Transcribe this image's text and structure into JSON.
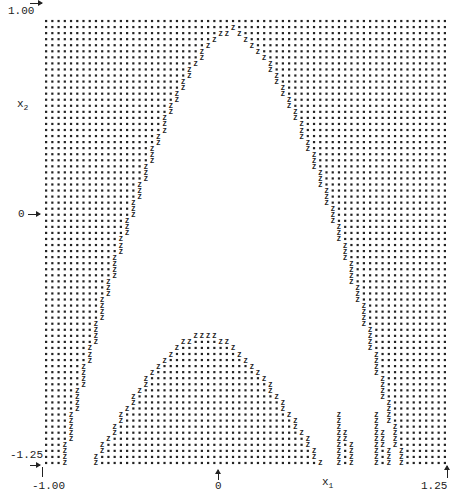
{
  "chart_data": {
    "type": "scatter",
    "title": "",
    "style": "line-printer dot-matrix region plot",
    "xlabel": "x1",
    "ylabel": "x2",
    "xlim": [
      -1.0,
      1.25
    ],
    "ylim": [
      -1.25,
      1.0
    ],
    "x_ticks": [
      {
        "value": -1.0,
        "label": "-1.00"
      },
      {
        "value": 0,
        "label": "0"
      },
      {
        "value": 1.25,
        "label": "1.25"
      }
    ],
    "y_ticks": [
      {
        "value": 1.0,
        "label": "1.00"
      },
      {
        "value": 0,
        "label": "0"
      },
      {
        "value": -1.25,
        "label": "-1.25"
      }
    ],
    "grid": {
      "cols": 65,
      "rows": 74
    },
    "markers": {
      "filled": "•",
      "boundary": "Z",
      "empty": " "
    },
    "regions": {
      "description": "Dots mark points in the region; 'Z' marks boundary points; blank area is an arch-shaped empty region opening downward with a filled dome inside at the bottom-center and two narrow filled strips at lower right.",
      "outer_arch": {
        "apex": {
          "x1": 0.05,
          "x2": 0.93
        },
        "left_foot": {
          "x1": -0.88,
          "x2": -1.25
        },
        "right_foot": {
          "x1": 0.98,
          "x2": -1.25
        }
      },
      "inner_dome": {
        "apex": {
          "x1": -0.1,
          "x2": -0.58
        },
        "left_foot": {
          "x1": -0.74,
          "x2": -1.25
        },
        "right_foot": {
          "x1": 0.56,
          "x2": -1.25
        }
      },
      "right_strips": [
        {
          "x1_range": [
            0.62,
            0.74
          ],
          "x2_top": -0.92,
          "x2_bottom": -1.25
        },
        {
          "x1_range": [
            0.82,
            0.93
          ],
          "x2_top": -0.9,
          "x2_bottom": -1.25
        }
      ]
    },
    "legend": null
  },
  "labels": {
    "y_top": "1.00",
    "y_mid": "0",
    "y_bottom": "-1.25",
    "x_left": "-1.00",
    "x_mid": "0",
    "x_right": "1.25",
    "x_axis_name": "x",
    "x_axis_sub": "1",
    "y_axis_name": "x",
    "y_axis_sub": "2"
  },
  "colors": {
    "ink": "#222222",
    "background": "#ffffff"
  }
}
